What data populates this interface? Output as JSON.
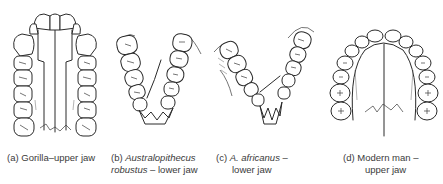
{
  "figure": {
    "panels": [
      {
        "id": "a",
        "label": "(a)",
        "name": "Gorilla",
        "name_italic": false,
        "separator": "–",
        "jaw": "upper jaw",
        "caption_line1": "(a) Gorilla–upper jaw",
        "caption_line2": ""
      },
      {
        "id": "b",
        "label": "(b)",
        "name": "Australopithecus",
        "name2": "robustus",
        "name_italic": true,
        "separator": " – ",
        "jaw": "lower jaw",
        "caption_line1_prefix": "(b) ",
        "caption_line1_italic": "Australopithecus",
        "caption_line2_italic": "robustus",
        "caption_line2_suffix": " – lower jaw"
      },
      {
        "id": "c",
        "label": "(c)",
        "name": "A. africanus",
        "name_italic": true,
        "separator": " –",
        "jaw": "lower jaw",
        "caption_line1_prefix": "(c) ",
        "caption_line1_italic": "A. africanus",
        "caption_line1_suffix": " –",
        "caption_line2": "lower jaw"
      },
      {
        "id": "d",
        "label": "(d)",
        "name": "Modern man",
        "name_italic": false,
        "separator": " –",
        "jaw": "upper jaw",
        "caption_line1": "(d) Modern man –",
        "caption_line2": "upper jaw"
      }
    ],
    "colors": {
      "line": "#2a2a2a",
      "background": "#ffffff",
      "caption": "#3a3a3a"
    }
  }
}
